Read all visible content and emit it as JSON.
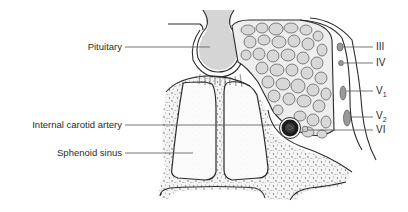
{
  "figure": {
    "labels_left": [
      {
        "id": "pituitary",
        "text": "Pituitary",
        "y": 47
      },
      {
        "id": "internal-carotid-artery",
        "text": "Internal carotid artery",
        "y": 125
      },
      {
        "id": "sphenoid-sinus",
        "text": "Sphenoid sinus",
        "y": 153
      }
    ],
    "labels_right": [
      {
        "id": "cn-iii",
        "text": "III",
        "sub": "",
        "y": 47
      },
      {
        "id": "cn-iv",
        "text": "IV",
        "sub": "",
        "y": 63
      },
      {
        "id": "cn-v1",
        "text": "V",
        "sub": "1",
        "y": 91
      },
      {
        "id": "cn-v2",
        "text": "V",
        "sub": "2",
        "y": 117
      },
      {
        "id": "cn-vi",
        "text": "VI",
        "sub": "",
        "y": 130
      }
    ]
  },
  "colors": {
    "line": "#2b2b2b",
    "label": "#2a2a2a",
    "cell_fill": "#d8d8d8",
    "nerve_fill": "#9a9a9a",
    "artery_fill": "#1c1c1c"
  }
}
